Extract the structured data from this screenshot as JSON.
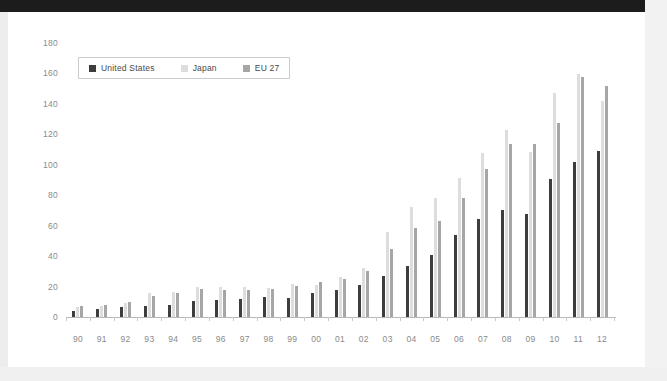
{
  "window": {
    "header_bar_color": "#1c1c1c",
    "card_background": "#ffffff",
    "page_background": "#ededed"
  },
  "legend": {
    "items": [
      {
        "label": "United States",
        "color": "#3d3d3d",
        "swatch_name": "legend-swatch-united-states"
      },
      {
        "label": "Japan",
        "color": "#dddddd",
        "swatch_name": "legend-swatch-japan"
      },
      {
        "label": "EU 27",
        "color": "#a6a6a6",
        "swatch_name": "legend-swatch-eu-27"
      }
    ]
  },
  "chart_data": {
    "type": "bar",
    "title": "",
    "subtitle": "",
    "xlabel": "",
    "ylabel": "",
    "ylim": [
      0,
      180
    ],
    "ytick_step": 20,
    "yticks": [
      0,
      20,
      40,
      60,
      80,
      100,
      120,
      140,
      160,
      180
    ],
    "ytick_labels": [
      "0",
      "20",
      "40",
      "60",
      "80",
      "100",
      "120",
      "140",
      "160",
      "180"
    ],
    "grid": false,
    "legend_position": "top-left",
    "categories": [
      "90",
      "91",
      "92",
      "93",
      "94",
      "95",
      "96",
      "97",
      "98",
      "99",
      "00",
      "01",
      "02",
      "03",
      "04",
      "05",
      "06",
      "07",
      "08",
      "09",
      "10",
      "11",
      "12"
    ],
    "series": [
      {
        "name": "United States",
        "color": "#3d3d3d",
        "values": [
          4,
          5,
          6.5,
          7.5,
          8,
          10.5,
          11,
          12,
          13,
          12.5,
          15.5,
          18,
          21,
          27,
          33.5,
          40.5,
          54,
          64.5,
          70,
          68,
          90.5,
          102,
          109
        ]
      },
      {
        "name": "Japan",
        "color": "#dddddd",
        "values": [
          6.5,
          7.5,
          9,
          15.5,
          16.5,
          20,
          19.5,
          19.5,
          19,
          21.5,
          21,
          26.5,
          32,
          56,
          72.5,
          78.5,
          91.5,
          107.5,
          123,
          108.5,
          147,
          159.5,
          142
        ]
      },
      {
        "name": "EU 27",
        "color": "#a6a6a6",
        "values": [
          7,
          8,
          10,
          13.5,
          15.5,
          18.5,
          17.5,
          17.5,
          18.5,
          20.5,
          23,
          25,
          30.5,
          45,
          58.5,
          63,
          78,
          97,
          113.5,
          113.5,
          127.5,
          157.5,
          151.5
        ]
      }
    ]
  }
}
